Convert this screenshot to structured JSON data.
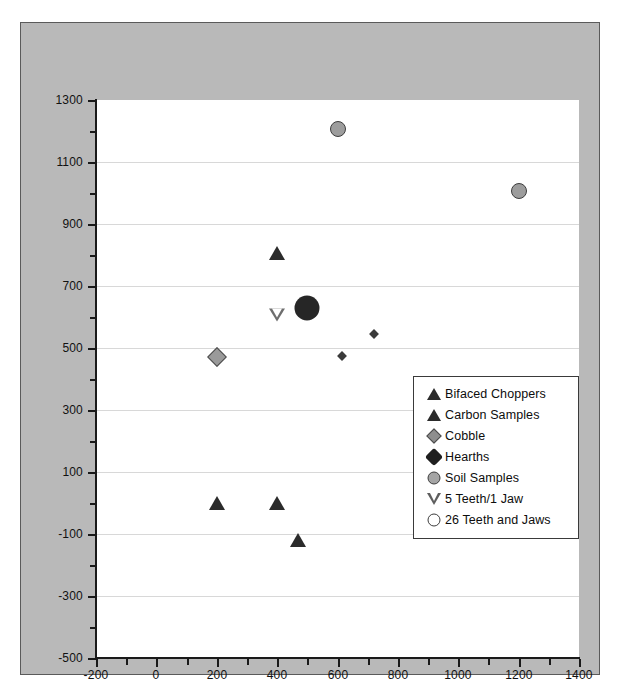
{
  "chart_data": {
    "type": "scatter",
    "title": "",
    "xlabel": "",
    "ylabel": "",
    "xlim": [
      -200,
      1400
    ],
    "ylim": [
      -500,
      1300
    ],
    "x_ticks": [
      -200,
      0,
      200,
      400,
      600,
      800,
      1000,
      1200,
      1400
    ],
    "y_ticks": [
      -500,
      -300,
      -100,
      100,
      300,
      500,
      700,
      900,
      1100,
      1300
    ],
    "x_tick_labels": [
      "-200",
      "0",
      "200",
      "400",
      "600",
      "800",
      "1000",
      "1200",
      "1400"
    ],
    "y_tick_labels": [
      "-500",
      "-300",
      "-100",
      "100",
      "300",
      "500",
      "700",
      "900",
      "1100",
      "1300"
    ],
    "x_minor_step": 100,
    "y_minor_step": 100,
    "grid": "horizontal-major",
    "legend_position": "center-right",
    "series": [
      {
        "name": "Bifaced Choppers",
        "marker": "triangle-up-filled",
        "color": "#2b2b2b",
        "points": [
          {
            "x": 400,
            "y": 805
          }
        ]
      },
      {
        "name": "Carbon Samples",
        "marker": "triangle-up-filled",
        "color": "#2b2b2b",
        "points": [
          {
            "x": 200,
            "y": 0
          },
          {
            "x": 400,
            "y": 0
          },
          {
            "x": 470,
            "y": -120
          }
        ]
      },
      {
        "name": "Cobble",
        "marker": "diamond-gray",
        "color": "#9a9a9a",
        "points": [
          {
            "x": 200,
            "y": 470
          },
          {
            "x": 615,
            "y": 475
          },
          {
            "x": 720,
            "y": 545
          }
        ]
      },
      {
        "name": "Hearths",
        "marker": "circle-filled-large",
        "color": "#262626",
        "points": [
          {
            "x": 500,
            "y": 630
          }
        ]
      },
      {
        "name": "Soil Samples",
        "marker": "circle-gray",
        "color": "#9d9d9d",
        "points": [
          {
            "x": 600,
            "y": 1205
          },
          {
            "x": 1200,
            "y": 1005
          }
        ]
      },
      {
        "name": "5 Teeth/1 Jaw",
        "marker": "triangle-down-open",
        "color": "#6e6e6e",
        "points": [
          {
            "x": 400,
            "y": 605
          }
        ]
      },
      {
        "name": "26 Teeth and Jaws",
        "marker": "circle-open",
        "color": "#ffffff",
        "points": []
      }
    ]
  },
  "legend": {
    "items": [
      {
        "label": "Bifaced Choppers",
        "icon": "triangle-up-filled-icon"
      },
      {
        "label": "Carbon Samples",
        "icon": "triangle-up-filled-icon"
      },
      {
        "label": "Cobble",
        "icon": "diamond-gray-icon"
      },
      {
        "label": "Hearths",
        "icon": "diamond-black-icon"
      },
      {
        "label": "Soil Samples",
        "icon": "circle-gray-icon"
      },
      {
        "label": "5 Teeth/1 Jaw",
        "icon": "triangle-down-open-icon"
      },
      {
        "label": "26 Teeth and Jaws",
        "icon": "circle-open-icon"
      }
    ]
  },
  "colors": {
    "panel_background": "#b9b9b9",
    "plot_background": "#ffffff",
    "gridline": "#d8d8d8",
    "axis": "#1a1a1a",
    "text": "#111111"
  }
}
